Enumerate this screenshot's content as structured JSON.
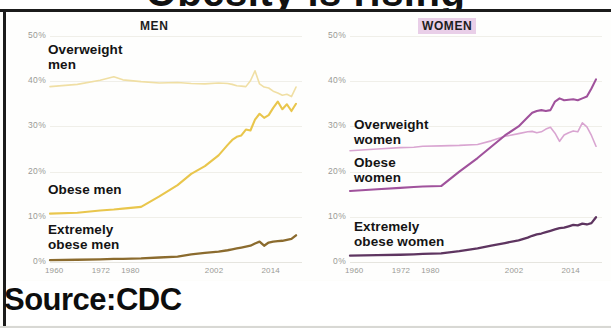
{
  "headline": {
    "cropped_title": "Obesity is rising"
  },
  "source": {
    "label": "Source:CDC"
  },
  "panels": [
    {
      "key": "men",
      "title": "MEN",
      "yticks": [
        "50%",
        "40%",
        "30%",
        "20%",
        "10%",
        "0%"
      ],
      "xticks": [
        "1960",
        "1972",
        "1980",
        "2002",
        "2014"
      ],
      "series_labels": [
        {
          "id": "overweight-men",
          "text": "Overweight\nmen"
        },
        {
          "id": "obese-men",
          "text": "Obese men"
        },
        {
          "id": "extremely-obese-men",
          "text": "Extremely\nobese men"
        }
      ]
    },
    {
      "key": "women",
      "title": "WOMEN",
      "yticks": [
        "50%",
        "40%",
        "30%",
        "20%",
        "10%",
        "0%"
      ],
      "xticks": [
        "1960",
        "1972",
        "1980",
        "2002",
        "2014"
      ],
      "series_labels": [
        {
          "id": "overweight-women",
          "text": "Overweight\nwomen"
        },
        {
          "id": "obese-women",
          "text": "Obese\nwomen"
        },
        {
          "id": "extremely-obese-women",
          "text": "Extremely\nobese women"
        }
      ]
    }
  ],
  "colors": {
    "overweight_men": "#F0DFA4",
    "obese_men": "#E9C64C",
    "extremely_obese_men": "#8B6B2E",
    "overweight_women": "#D9A5D1",
    "obese_women": "#A0529C",
    "extremely_obese_women": "#5E3560",
    "women_title_highlight": "#E9CFE8",
    "rule": "#1B1B1B",
    "tick_text": "#9A9A95",
    "label_text": "#141414"
  },
  "chart_data": {
    "type": "line",
    "title": "Obesity is rising",
    "subtitle": "",
    "xlabel": "",
    "ylabel": "",
    "xlim": [
      1960,
      2014
    ],
    "ylim": [
      0,
      50
    ],
    "yticks": [
      0,
      10,
      20,
      30,
      40,
      50
    ],
    "xticks": [
      1960,
      1972,
      1980,
      2002,
      2014
    ],
    "grid": true,
    "legend_position": "inline-annotations",
    "units": "percent of adults",
    "panels": [
      {
        "panel": "MEN",
        "x": [
          1960,
          1966,
          1971,
          1974,
          1976,
          1980,
          1984,
          1988,
          1991,
          1994,
          1997,
          1999,
          2000,
          2001,
          2002,
          2003,
          2004,
          2005,
          2006,
          2007,
          2008,
          2009,
          2010,
          2011,
          2012,
          2013,
          2014
        ],
        "series": [
          {
            "name": "Overweight men",
            "color": "#F0DFA4",
            "values": [
              38.8,
              39.3,
              40.2,
              41.0,
              40.3,
              39.9,
              39.6,
              39.7,
              39.5,
              39.4,
              39.6,
              39.5,
              39.3,
              39.0,
              38.9,
              38.8,
              40.1,
              42.3,
              39.4,
              38.7,
              38.5,
              37.8,
              37.4,
              36.9,
              37.1,
              36.6,
              38.7
            ]
          },
          {
            "name": "Obese men",
            "color": "#E9C64C",
            "values": [
              10.7,
              10.9,
              11.4,
              11.6,
              11.8,
              12.2,
              14.5,
              17.0,
              19.5,
              21.2,
              23.6,
              25.9,
              27.0,
              27.7,
              28.0,
              29.3,
              29.1,
              31.5,
              32.8,
              31.9,
              32.5,
              34.1,
              35.5,
              33.8,
              34.9,
              33.4,
              35.0
            ]
          },
          {
            "name": "Extremely obese men",
            "color": "#8B6B2E",
            "values": [
              0.4,
              0.5,
              0.6,
              0.7,
              0.7,
              0.8,
              1.0,
              1.2,
              1.7,
              2.0,
              2.3,
              2.6,
              2.8,
              3.0,
              3.2,
              3.4,
              3.6,
              4.1,
              4.5,
              3.6,
              4.3,
              4.5,
              4.6,
              4.7,
              4.9,
              5.1,
              5.9
            ]
          }
        ]
      },
      {
        "panel": "WOMEN",
        "x": [
          1960,
          1966,
          1971,
          1974,
          1976,
          1980,
          1984,
          1988,
          1991,
          1994,
          1997,
          1999,
          2000,
          2001,
          2002,
          2003,
          2004,
          2005,
          2006,
          2007,
          2008,
          2009,
          2010,
          2011,
          2012,
          2013,
          2014
        ],
        "series": [
          {
            "name": "Overweight women",
            "color": "#D9A5D1",
            "values": [
              24.6,
              25.0,
              25.3,
              25.4,
              25.6,
              25.7,
              25.8,
              26.0,
              26.8,
              27.8,
              28.4,
              28.8,
              28.9,
              28.6,
              28.8,
              29.4,
              29.8,
              28.5,
              26.7,
              28.1,
              28.6,
              29.0,
              28.8,
              30.8,
              29.9,
              28.0,
              25.6
            ]
          },
          {
            "name": "Obese women",
            "color": "#A0529C",
            "values": [
              15.7,
              16.1,
              16.4,
              16.6,
              16.7,
              16.8,
              20.0,
              23.0,
              25.5,
              28.0,
              30.0,
              32.0,
              33.0,
              33.4,
              33.6,
              33.4,
              33.6,
              35.5,
              36.2,
              35.8,
              35.9,
              36.0,
              35.8,
              36.2,
              36.6,
              38.4,
              40.4
            ]
          },
          {
            "name": "Extremely obese women",
            "color": "#5E3560",
            "values": [
              1.4,
              1.5,
              1.6,
              1.7,
              1.8,
              1.9,
              2.4,
              3.0,
              3.6,
              4.2,
              4.8,
              5.4,
              5.8,
              6.1,
              6.3,
              6.6,
              6.9,
              7.2,
              7.5,
              7.6,
              7.9,
              8.2,
              8.1,
              8.5,
              8.3,
              8.6,
              9.9
            ]
          }
        ]
      }
    ]
  }
}
